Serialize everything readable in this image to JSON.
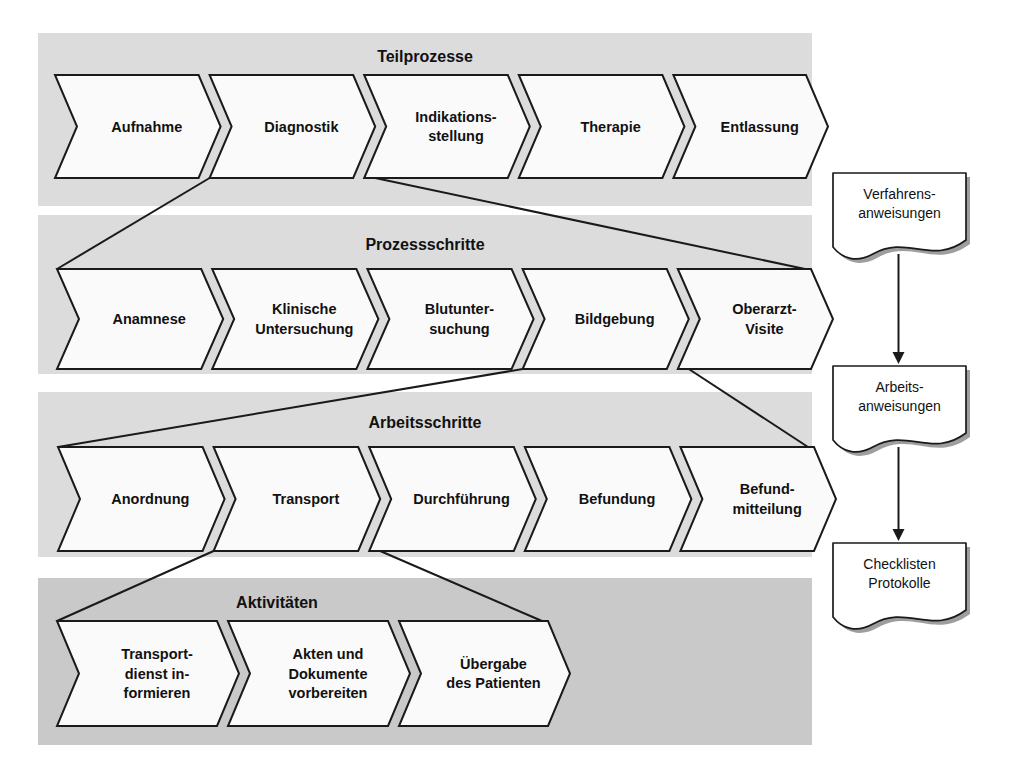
{
  "diagram": {
    "colors": {
      "band_light": "#dcdcdc",
      "band_dark": "#c9c9c9",
      "shape_fill": "#fafafa",
      "stroke": "#1a1a1a",
      "page": "#ffffff"
    },
    "bands": [
      {
        "id": "teilprozesse",
        "label": "Teilprozesse",
        "shade": "light",
        "items": [
          {
            "label": "Aufnahme"
          },
          {
            "label": "Diagnostik"
          },
          {
            "label": "Indikations-\nstellung"
          },
          {
            "label": "Therapie"
          },
          {
            "label": "Entlassung"
          }
        ]
      },
      {
        "id": "prozessschritte",
        "label": "Prozessschritte",
        "shade": "light",
        "items": [
          {
            "label": "Anamnese"
          },
          {
            "label": "Klinische\nUntersuchung"
          },
          {
            "label": "Blutunter-\nsuchung"
          },
          {
            "label": "Bildgebung"
          },
          {
            "label": "Oberarzt-\nVisite"
          }
        ]
      },
      {
        "id": "arbeitsschritte",
        "label": "Arbeitsschritte",
        "shade": "light",
        "items": [
          {
            "label": "Anordnung"
          },
          {
            "label": "Transport"
          },
          {
            "label": "Durchführung"
          },
          {
            "label": "Befundung"
          },
          {
            "label": "Befund-\nmitteilung"
          }
        ]
      },
      {
        "id": "aktivitaeten",
        "label": "Aktivitäten",
        "shade": "dark",
        "items": [
          {
            "label": "Transport-\ndienst in-\nformieren"
          },
          {
            "label": "Akten und\nDokumente\nvorbereiten"
          },
          {
            "label": "Übergabe\ndes Patienten"
          }
        ]
      }
    ],
    "documents": [
      {
        "id": "verfahrensanweisungen",
        "label": "Verfahrens-\nanweisungen"
      },
      {
        "id": "arbeitsanweisungen",
        "label": "Arbeits-\nanweisungen"
      },
      {
        "id": "checklisten",
        "label": "Checklisten\nProtokolle"
      }
    ],
    "document_arrows": [
      {
        "from": "verfahrensanweisungen",
        "to": "arbeitsanweisungen"
      },
      {
        "from": "arbeitsanweisungen",
        "to": "checklisten"
      }
    ],
    "drilldowns": [
      {
        "from_band": "teilprozesse",
        "from_item": "Diagnostik",
        "to_band": "prozessschritte"
      },
      {
        "from_band": "prozessschritte",
        "from_item": "Bildgebung",
        "to_band": "arbeitsschritte"
      },
      {
        "from_band": "arbeitsschritte",
        "from_item": "Transport",
        "to_band": "aktivitaeten"
      }
    ]
  }
}
